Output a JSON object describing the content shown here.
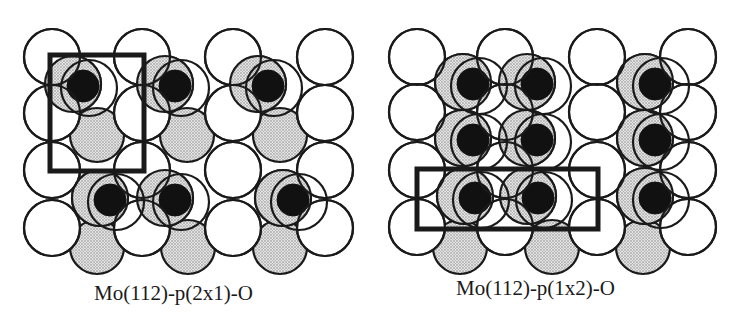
{
  "figure": {
    "panels": [
      {
        "id": "p2x1",
        "caption": "Mo(112)-p(2x1)-O",
        "white_atoms": [
          [
            52,
            57
          ],
          [
            142,
            57
          ],
          [
            233,
            57
          ],
          [
            325,
            57
          ],
          [
            52,
            113
          ],
          [
            142,
            113
          ],
          [
            233,
            113
          ],
          [
            325,
            113
          ],
          [
            52,
            170
          ],
          [
            142,
            170
          ],
          [
            233,
            170
          ],
          [
            325,
            170
          ],
          [
            52,
            228
          ],
          [
            142,
            228
          ],
          [
            233,
            228
          ],
          [
            325,
            228
          ]
        ],
        "gray_atoms": [
          [
            97,
            135
          ],
          [
            187,
            135
          ],
          [
            280,
            135
          ],
          [
            97,
            247
          ],
          [
            188,
            247
          ],
          [
            280,
            247
          ]
        ],
        "oxygen_sites": [
          [
            83,
            86
          ],
          [
            175,
            86
          ],
          [
            268,
            86
          ],
          [
            110,
            200
          ],
          [
            175,
            200
          ],
          [
            293,
            200
          ]
        ],
        "unit_cell": {
          "x": 50,
          "y": 55,
          "w": 94,
          "h": 116
        }
      },
      {
        "id": "p1x2",
        "caption": "Mo(112)-p(1x2)-O",
        "white_atoms": [
          [
            417,
            57
          ],
          [
            505,
            57
          ],
          [
            597,
            57
          ],
          [
            688,
            57
          ],
          [
            417,
            112
          ],
          [
            505,
            112
          ],
          [
            597,
            112
          ],
          [
            688,
            112
          ],
          [
            417,
            170
          ],
          [
            505,
            170
          ],
          [
            597,
            170
          ],
          [
            688,
            170
          ],
          [
            417,
            227
          ],
          [
            505,
            227
          ],
          [
            597,
            227
          ],
          [
            688,
            227
          ]
        ],
        "gray_atoms": [
          [
            460,
            247
          ],
          [
            552,
            247
          ],
          [
            643,
            247
          ]
        ],
        "oxygen_sites": [
          [
            473,
            84
          ],
          [
            537,
            84
          ],
          [
            655,
            84
          ],
          [
            473,
            140
          ],
          [
            537,
            140
          ],
          [
            655,
            140
          ],
          [
            475,
            198
          ],
          [
            538,
            198
          ],
          [
            655,
            198
          ]
        ],
        "unit_cell": {
          "x": 417,
          "y": 169,
          "w": 181,
          "h": 60
        }
      }
    ],
    "legend_semantics": {
      "white_circle": "top-layer Mo atom",
      "gray_circle": "second-layer Mo atom",
      "black_dot": "adsorbed O atom",
      "bold_rectangle": "surface unit cell"
    },
    "colors": {
      "outline": "#1a1a1a",
      "gray_fill": "#cfcfcf",
      "oxygen": "#111111",
      "white_fill": "#ffffff"
    }
  }
}
